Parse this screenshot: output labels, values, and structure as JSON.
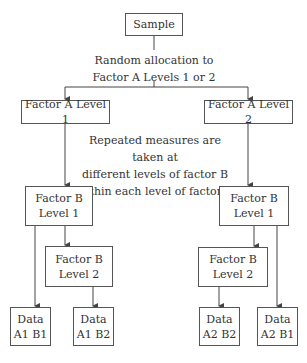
{
  "diagram": {
    "sample": "Sample",
    "allocation_note": [
      "Random allocation to",
      "Factor A Levels 1 or 2"
    ],
    "factor_a_level1": "Factor A Level 1",
    "factor_a_level2": "Factor A Level 2",
    "repeated_note": [
      "Repeated measures are taken at",
      "different levels of factor B",
      "within each level of factor A"
    ],
    "left_branch": {
      "factor_b_level1": [
        "Factor B",
        "Level 1"
      ],
      "factor_b_level2": [
        "Factor B",
        "Level 2"
      ],
      "data_a1b1": [
        "Data",
        "A1 B1"
      ],
      "data_a1b2": [
        "Data",
        "A1 B2"
      ]
    },
    "right_branch": {
      "factor_b_level1": [
        "Factor B",
        "Level 1"
      ],
      "factor_b_level2": [
        "Factor B",
        "Level 2"
      ],
      "data_a2b2": [
        "Data",
        "A2 B2"
      ],
      "data_a2b1": [
        "Data",
        "A2 B1"
      ]
    },
    "colors": {
      "line": "#444444",
      "text": "#333333",
      "background": "#ffffff"
    }
  }
}
